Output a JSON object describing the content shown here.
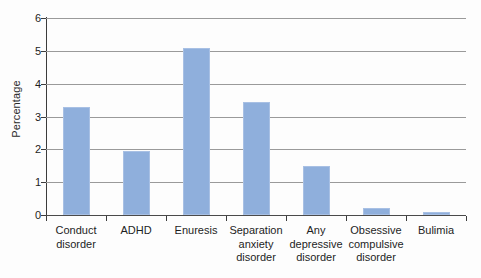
{
  "chart_data": {
    "type": "bar",
    "title": "",
    "xlabel": "",
    "ylabel": "Percentage",
    "categories": [
      "Conduct disorder",
      "ADHD",
      "Enuresis",
      "Separation anxiety disorder",
      "Any depressive disorder",
      "Obsessive compulsive disorder",
      "Bulimia"
    ],
    "values": [
      3.3,
      1.95,
      5.1,
      3.45,
      1.5,
      0.2,
      0.1
    ],
    "ylim": [
      0,
      6
    ],
    "yticks": [
      0,
      1,
      2,
      3,
      4,
      5,
      6
    ],
    "ytick_labels": [
      "0",
      "1",
      "2",
      "3",
      "4",
      "5",
      "6"
    ],
    "grid": true,
    "legend": "none",
    "bar_color": "#8fafdc"
  },
  "axis": {
    "y_title": "Percentage",
    "ticks": [
      "6",
      "5",
      "4",
      "3",
      "2",
      "1",
      "0"
    ]
  },
  "categories": [
    {
      "line1": "Conduct",
      "line2": "disorder",
      "line3": ""
    },
    {
      "line1": "ADHD",
      "line2": "",
      "line3": ""
    },
    {
      "line1": "Enuresis",
      "line2": "",
      "line3": ""
    },
    {
      "line1": "Separation",
      "line2": "anxiety",
      "line3": "disorder"
    },
    {
      "line1": "Any",
      "line2": "depressive",
      "line3": "disorder"
    },
    {
      "line1": "Obsessive",
      "line2": "compulsive",
      "line3": "disorder"
    },
    {
      "line1": "Bulimia",
      "line2": "",
      "line3": ""
    }
  ]
}
